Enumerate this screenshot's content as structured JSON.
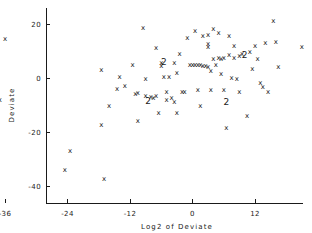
{
  "chart_data": {
    "type": "scatter",
    "title": "",
    "xlabel": "Log2 of Deviate",
    "ylabel": "Deviate",
    "xlim": [
      -42,
      28
    ],
    "ylim": [
      -44,
      24
    ],
    "grid": false,
    "legend": "none",
    "marker_symbol": "x",
    "overplot_symbol_note": "numeric glyph indicates count of coincident points",
    "xticks": [
      -36,
      -24,
      -12,
      0,
      12,
      24
    ],
    "xtick_labels": [
      "-36",
      "-24",
      "-12",
      "0",
      "12",
      "24"
    ],
    "yticks": [
      20,
      0,
      -20,
      -40
    ],
    "ytick_labels": [
      "20",
      "0",
      "-20",
      "-40"
    ],
    "points": [
      {
        "x": -36.0,
        "y": 14.5,
        "n": 1
      },
      {
        "x": -37.0,
        "y": -8.0,
        "n": 1
      },
      {
        "x": -24.5,
        "y": -34.0,
        "n": 1
      },
      {
        "x": -23.5,
        "y": -27.0,
        "n": 1
      },
      {
        "x": -17.0,
        "y": -37.5,
        "n": 1
      },
      {
        "x": -17.5,
        "y": -17.5,
        "n": 1
      },
      {
        "x": -17.5,
        "y": 3.0,
        "n": 1
      },
      {
        "x": -16.0,
        "y": -10.5,
        "n": 1
      },
      {
        "x": -14.5,
        "y": -4.0,
        "n": 1
      },
      {
        "x": -14.0,
        "y": 0.5,
        "n": 1
      },
      {
        "x": -13.0,
        "y": -3.0,
        "n": 1
      },
      {
        "x": -11.5,
        "y": 5.0,
        "n": 1
      },
      {
        "x": -11.0,
        "y": -6.0,
        "n": 1
      },
      {
        "x": -10.5,
        "y": -5.5,
        "n": 1
      },
      {
        "x": -10.5,
        "y": -16.0,
        "n": 1
      },
      {
        "x": -9.5,
        "y": 18.5,
        "n": 1
      },
      {
        "x": -9.0,
        "y": -0.5,
        "n": 1
      },
      {
        "x": -9.0,
        "y": -6.5,
        "n": 1
      },
      {
        "x": -8.5,
        "y": -8.5,
        "n": 2
      },
      {
        "x": -8.0,
        "y": -7.0,
        "n": 1
      },
      {
        "x": -7.5,
        "y": -7.5,
        "n": 1
      },
      {
        "x": -7.0,
        "y": 11.0,
        "n": 1
      },
      {
        "x": -7.0,
        "y": -6.5,
        "n": 1
      },
      {
        "x": -6.5,
        "y": -13.0,
        "n": 1
      },
      {
        "x": -6.0,
        "y": 5.5,
        "n": 1
      },
      {
        "x": -6.0,
        "y": 4.5,
        "n": 1
      },
      {
        "x": -5.5,
        "y": 6.0,
        "n": 2
      },
      {
        "x": -5.5,
        "y": 0.5,
        "n": 1
      },
      {
        "x": -5.0,
        "y": -5.0,
        "n": 1
      },
      {
        "x": -5.0,
        "y": -8.0,
        "n": 1
      },
      {
        "x": -4.5,
        "y": 0.5,
        "n": 1
      },
      {
        "x": -4.0,
        "y": -7.5,
        "n": 1
      },
      {
        "x": -3.5,
        "y": 5.5,
        "n": 1
      },
      {
        "x": -3.5,
        "y": -9.0,
        "n": 1
      },
      {
        "x": -3.0,
        "y": 2.0,
        "n": 1
      },
      {
        "x": -3.0,
        "y": -13.0,
        "n": 1
      },
      {
        "x": -2.5,
        "y": 9.0,
        "n": 1
      },
      {
        "x": -2.0,
        "y": -5.0,
        "n": 1
      },
      {
        "x": -1.5,
        "y": -5.0,
        "n": 1
      },
      {
        "x": -1.0,
        "y": 15.0,
        "n": 1
      },
      {
        "x": -0.5,
        "y": 5.0,
        "n": 1
      },
      {
        "x": 0.0,
        "y": 5.0,
        "n": 1
      },
      {
        "x": 0.5,
        "y": 17.5,
        "n": 1
      },
      {
        "x": 0.5,
        "y": 5.0,
        "n": 1
      },
      {
        "x": 1.0,
        "y": 5.0,
        "n": 1
      },
      {
        "x": 1.0,
        "y": -4.5,
        "n": 1
      },
      {
        "x": 1.5,
        "y": 5.0,
        "n": 1
      },
      {
        "x": 1.5,
        "y": -10.5,
        "n": 1
      },
      {
        "x": 2.0,
        "y": 15.5,
        "n": 1
      },
      {
        "x": 2.0,
        "y": 4.5,
        "n": 1
      },
      {
        "x": 2.5,
        "y": 4.5,
        "n": 1
      },
      {
        "x": 3.0,
        "y": 16.0,
        "n": 1
      },
      {
        "x": 3.0,
        "y": 12.5,
        "n": 1
      },
      {
        "x": 3.0,
        "y": 11.5,
        "n": 1
      },
      {
        "x": 3.0,
        "y": 4.0,
        "n": 1
      },
      {
        "x": 3.5,
        "y": 2.5,
        "n": 1
      },
      {
        "x": 3.5,
        "y": -4.5,
        "n": 1
      },
      {
        "x": 4.0,
        "y": 18.0,
        "n": 1
      },
      {
        "x": 4.0,
        "y": 7.0,
        "n": 1
      },
      {
        "x": 4.5,
        "y": 5.0,
        "n": 1
      },
      {
        "x": 5.0,
        "y": 16.5,
        "n": 1
      },
      {
        "x": 5.0,
        "y": 7.5,
        "n": 1
      },
      {
        "x": 5.5,
        "y": 7.0,
        "n": 1
      },
      {
        "x": 5.5,
        "y": 1.5,
        "n": 1
      },
      {
        "x": 6.0,
        "y": 7.5,
        "n": 1
      },
      {
        "x": 6.0,
        "y": -4.5,
        "n": 1
      },
      {
        "x": 6.5,
        "y": -9.0,
        "n": 2
      },
      {
        "x": 6.5,
        "y": -18.5,
        "n": 1
      },
      {
        "x": 7.0,
        "y": 15.5,
        "n": 1
      },
      {
        "x": 7.0,
        "y": 8.5,
        "n": 1
      },
      {
        "x": 7.5,
        "y": 0.0,
        "n": 1
      },
      {
        "x": 8.0,
        "y": 12.0,
        "n": 1
      },
      {
        "x": 8.0,
        "y": 7.5,
        "n": 1
      },
      {
        "x": 8.5,
        "y": -0.5,
        "n": 1
      },
      {
        "x": 9.0,
        "y": 8.0,
        "n": 1
      },
      {
        "x": 9.0,
        "y": -5.0,
        "n": 1
      },
      {
        "x": 9.5,
        "y": 9.0,
        "n": 1
      },
      {
        "x": 10.0,
        "y": 8.5,
        "n": 2
      },
      {
        "x": 10.5,
        "y": -14.0,
        "n": 1
      },
      {
        "x": 11.0,
        "y": 9.5,
        "n": 1
      },
      {
        "x": 11.5,
        "y": 3.5,
        "n": 1
      },
      {
        "x": 12.0,
        "y": 12.0,
        "n": 1
      },
      {
        "x": 12.5,
        "y": 7.0,
        "n": 1
      },
      {
        "x": 13.0,
        "y": -2.0,
        "n": 1
      },
      {
        "x": 13.5,
        "y": -3.5,
        "n": 1
      },
      {
        "x": 14.0,
        "y": 13.0,
        "n": 1
      },
      {
        "x": 14.5,
        "y": -5.0,
        "n": 1
      },
      {
        "x": 15.5,
        "y": 21.0,
        "n": 1
      },
      {
        "x": 16.0,
        "y": 13.5,
        "n": 1
      },
      {
        "x": 16.5,
        "y": 4.0,
        "n": 1
      },
      {
        "x": 21.0,
        "y": 11.5,
        "n": 1
      }
    ]
  },
  "axes": {
    "x_title": "Log2 of Deviate",
    "y_title": "Deviate"
  }
}
